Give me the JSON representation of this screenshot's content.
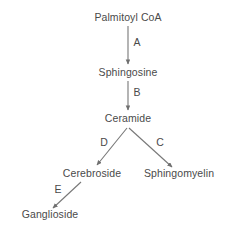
{
  "diagram": {
    "type": "flow-diagram",
    "background_color": "#ffffff",
    "text_color": "#4a4a4a",
    "arrow_color": "#777777",
    "nodes": [
      {
        "id": "palmitoyl-coa",
        "label": "Palmitoyl CoA",
        "x": 128,
        "y": 20
      },
      {
        "id": "sphingosine",
        "label": "Sphingosine",
        "x": 128,
        "y": 75
      },
      {
        "id": "ceramide",
        "label": "Ceramide",
        "x": 128,
        "y": 121
      },
      {
        "id": "cerebroside",
        "label": "Cerebroside",
        "x": 92,
        "y": 176
      },
      {
        "id": "sphingomyelin",
        "label": "Sphingomyelin",
        "x": 179,
        "y": 176
      },
      {
        "id": "ganglioside",
        "label": "Ganglioside",
        "x": 50,
        "y": 217
      }
    ],
    "steps": [
      {
        "id": "step-a",
        "label": "A",
        "from": "palmitoyl-coa",
        "to": "sphingosine",
        "x": 137,
        "y": 45
      },
      {
        "id": "step-b",
        "label": "B",
        "from": "sphingosine",
        "to": "ceramide",
        "x": 137,
        "y": 95
      },
      {
        "id": "step-c",
        "label": "C",
        "from": "ceramide",
        "to": "sphingomyelin",
        "x": 160,
        "y": 145
      },
      {
        "id": "step-d",
        "label": "D",
        "from": "ceramide",
        "to": "cerebroside",
        "x": 104,
        "y": 145
      },
      {
        "id": "step-e",
        "label": "E",
        "from": "cerebroside",
        "to": "ganglioside",
        "x": 58,
        "y": 192
      }
    ],
    "edges": [
      {
        "id": "edge-a",
        "x1": 128,
        "y1": 26,
        "x2": 128,
        "y2": 64
      },
      {
        "id": "edge-b",
        "x1": 128,
        "y1": 81,
        "x2": 128,
        "y2": 110
      },
      {
        "id": "edge-d",
        "x1": 127,
        "y1": 128,
        "x2": 97,
        "y2": 165
      },
      {
        "id": "edge-c",
        "x1": 129,
        "y1": 128,
        "x2": 172,
        "y2": 167
      },
      {
        "id": "edge-e",
        "x1": 81,
        "y1": 182,
        "x2": 53,
        "y2": 208
      }
    ]
  }
}
